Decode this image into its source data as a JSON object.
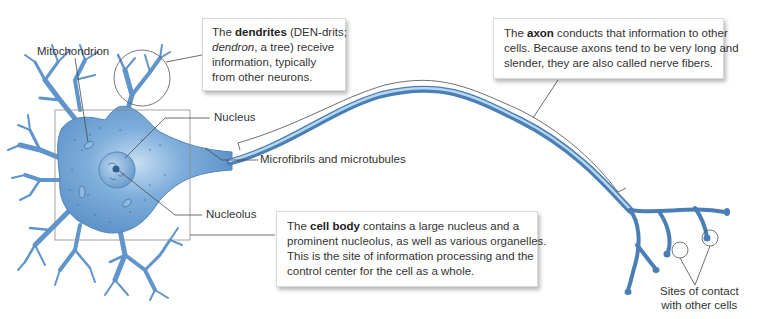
{
  "figure": {
    "colors": {
      "neuron_fill": "#6a9fd0",
      "neuron_light": "#a9cbea",
      "neuron_dark": "#3f74ab",
      "leader_line": "#4a4a4a",
      "callout_border": "#d8d8d8"
    }
  },
  "labels": {
    "mitochondrion": "Mitochondrion",
    "nucleus": "Nucleus",
    "microfibrils": "Microfibrils and microtubules",
    "nucleolus": "Nucleolus",
    "sites_line1": "Sites of contact",
    "sites_line2": "with other cells"
  },
  "callouts": {
    "dendrites": {
      "pre": "The ",
      "term": "dendrites",
      "line1_rest": " (DEN-drits;",
      "line2_italic": "dendron",
      "line2_rest": ", a tree) receive",
      "line3": "information, typically",
      "line4": "from other neurons."
    },
    "axon": {
      "pre": "The ",
      "term": "axon",
      "line1_rest": " conducts that information to other",
      "line2": "cells. Because axons tend to be very long and",
      "line3": "slender, they are also called nerve fibers."
    },
    "cell_body": {
      "pre": "The ",
      "term": "cell body",
      "line1_rest": " contains a large nucleus and a",
      "line2": "prominent nucleolus, as well as various organelles.",
      "line3": "This is the site of information processing and the",
      "line4": "control center for the cell as a whole."
    }
  }
}
